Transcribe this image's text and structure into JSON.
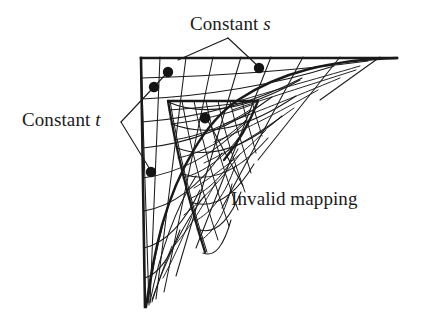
{
  "figure": {
    "background_color": "#ffffff",
    "line_color": "#1a1a1a",
    "dot_color": "#141414",
    "labels": {
      "constant_s": {
        "text": "Constant ",
        "italic_part": "s"
      },
      "constant_t": {
        "text": "Constant ",
        "italic_part": "t"
      },
      "invalid_mapping": {
        "text": "Invalid mapping"
      }
    },
    "annotation_dots": [
      {
        "name": "dot-upper-left-inner",
        "x": 168,
        "y": 72,
        "r": 5.2
      },
      {
        "name": "dot-left-upper",
        "x": 154,
        "y": 87,
        "r": 5.2
      },
      {
        "name": "dot-top-right",
        "x": 259,
        "y": 68,
        "r": 5.2
      },
      {
        "name": "dot-center",
        "x": 205,
        "y": 118,
        "r": 5.4
      },
      {
        "name": "dot-left-lower",
        "x": 151,
        "y": 172,
        "r": 5.2
      }
    ],
    "leader_lines": {
      "constant_s": [
        {
          "from": [
            228,
            38
          ],
          "to": [
            178,
            60
          ]
        },
        {
          "from": [
            228,
            38
          ],
          "to": [
            259,
            68
          ]
        }
      ],
      "constant_t": [
        {
          "from": [
            121,
            122
          ],
          "to": [
            167,
            73
          ]
        },
        {
          "from": [
            121,
            122
          ],
          "to": [
            151,
            172
          ]
        }
      ],
      "invalid_mapping": [
        {
          "from": [
            243,
            186
          ],
          "to": [
            208,
            120
          ]
        }
      ]
    },
    "boundary": {
      "corner": [
        141,
        58
      ],
      "top_right_end": [
        397,
        58
      ],
      "bottom_end": [
        146,
        307
      ],
      "curve_description": "hyperbolic inner curve from top-right to bottom tip"
    },
    "grid": {
      "s_lines": 9,
      "t_lines": 9,
      "description": "two overlapping curvilinear grids; inner dense grid folds over itself producing an invalid (inverted) mapping region"
    }
  }
}
